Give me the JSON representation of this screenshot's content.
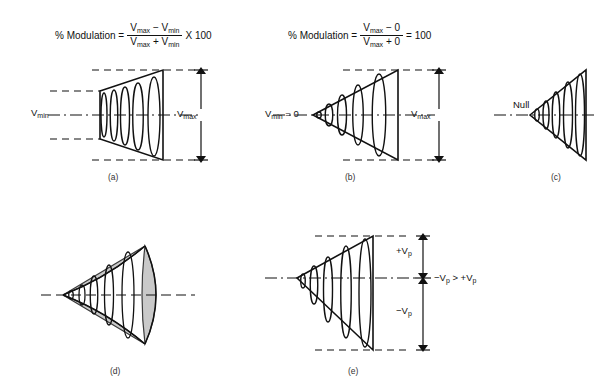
{
  "figure": {
    "caption_a": "(a)",
    "caption_b": "(b)",
    "caption_c": "(c)",
    "caption_d": "(d)",
    "caption_e": "(e)"
  },
  "formula_a": {
    "lead": "% Modulation =",
    "numerator": "Vmax − Vmin",
    "denominator": "Vmax + Vmin",
    "tail": "X 100"
  },
  "formula_b": {
    "lead": "% Modulation =",
    "numerator": "Vmax − 0",
    "denominator": "Vmax + 0",
    "tail": "= 100"
  },
  "panel_a": {
    "label_vmin": "Vmin",
    "label_vmax": "Vmax"
  },
  "panel_b": {
    "label_vmin": "Vmin = 0",
    "label_vmax": "Vmax"
  },
  "panel_c": {
    "label_null": "Null"
  },
  "panel_d": {
    "shade_color": "#c9c9c9"
  },
  "panel_e": {
    "label_vp_pos": "+Vp",
    "label_vp_neg": "−Vp",
    "label_relation": "−Vp > +Vp"
  },
  "colors": {
    "ink": "#111111",
    "shade": "#c9c9c9",
    "background": "#ffffff"
  }
}
